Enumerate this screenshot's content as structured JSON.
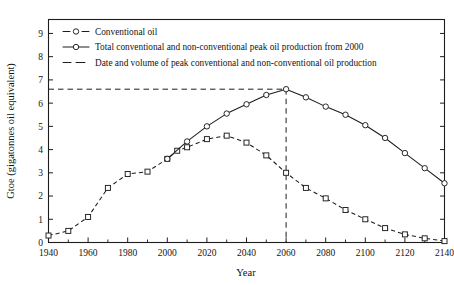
{
  "chart_data": {
    "type": "line",
    "title": "",
    "xlabel": "Year",
    "ylabel": "Gtoe (gigatonnes oil equivalent)",
    "xlim": [
      1940,
      2140
    ],
    "ylim": [
      0,
      9.6
    ],
    "xticks": [
      1940,
      1960,
      1980,
      2000,
      2020,
      2040,
      2060,
      2080,
      2100,
      2120,
      2140
    ],
    "xticklabels": [
      "1940",
      "1960",
      "1980",
      "2000",
      "2020",
      "2040",
      "2060",
      "2080",
      "2100",
      "2120",
      "2140"
    ],
    "yticks": [
      0,
      1,
      2,
      3,
      4,
      5,
      6,
      7,
      8,
      9
    ],
    "yticklabels": [
      "0",
      "1",
      "2",
      "3",
      "4",
      "5",
      "6",
      "7",
      "8",
      "9"
    ],
    "xtick_minor_step": 10,
    "grid": false,
    "legend_position": "top-left-inside",
    "series": [
      {
        "name": "Conventional oil",
        "style": "dashed",
        "marker": "square",
        "x": [
          1940,
          1950,
          1960,
          1970,
          1980,
          1990,
          2000,
          2005,
          2010,
          2020,
          2030,
          2040,
          2050,
          2060,
          2070,
          2080,
          2090,
          2100,
          2110,
          2120,
          2130,
          2140
        ],
        "y": [
          0.3,
          0.5,
          1.1,
          2.35,
          2.95,
          3.05,
          3.6,
          3.95,
          4.1,
          4.45,
          4.6,
          4.3,
          3.75,
          3.0,
          2.35,
          1.9,
          1.4,
          1.0,
          0.62,
          0.35,
          0.18,
          0.06
        ]
      },
      {
        "name": "Total conventional and non-conventional peak oil production from 2000",
        "style": "solid",
        "marker": "circle",
        "x": [
          2000,
          2010,
          2020,
          2030,
          2040,
          2050,
          2060,
          2070,
          2080,
          2090,
          2100,
          2110,
          2120,
          2130,
          2140
        ],
        "y": [
          3.6,
          4.35,
          5.0,
          5.55,
          5.95,
          6.35,
          6.6,
          6.25,
          5.85,
          5.5,
          5.05,
          4.5,
          3.85,
          3.2,
          2.55
        ]
      }
    ],
    "annotations": {
      "peak_year": 2060,
      "peak_value": 6.6,
      "peak_guide_label": "Date and volume of peak conventional and non-conventional oil production"
    }
  },
  "legend": {
    "items": [
      {
        "label": "Conventional oil",
        "style": "dashed",
        "marker": "circle"
      },
      {
        "label": "Total conventional and non-conventional peak oil production from 2000",
        "style": "solid",
        "marker": "circle"
      },
      {
        "label": "Date and volume of peak conventional and non-conventional oil production",
        "style": "dashed",
        "marker": "none"
      }
    ]
  },
  "colors": {
    "ink": "#1d1d1d",
    "background": "#ffffff",
    "marker_fill": "#ffffff"
  }
}
